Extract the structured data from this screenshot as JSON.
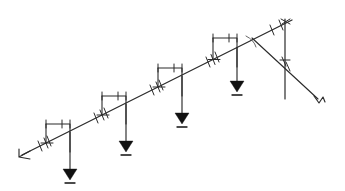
{
  "figure": {
    "type": "structural-schematic",
    "title": "",
    "background_color": "#ffffff",
    "line_color": "#2b2b2b",
    "fill_color": "#111111",
    "width": 345,
    "height": 191
  },
  "beam": {
    "name": "inclined-beam",
    "start": {
      "x": 22,
      "y": 155
    },
    "end": {
      "x": 292,
      "y": 20
    },
    "label": "",
    "tick_marks": [
      {
        "x": 40,
        "y": 146
      },
      {
        "x": 49,
        "y": 141
      },
      {
        "x": 96,
        "y": 118
      },
      {
        "x": 106,
        "y": 113
      },
      {
        "x": 152,
        "y": 90
      },
      {
        "x": 161,
        "y": 85
      },
      {
        "x": 208,
        "y": 62
      },
      {
        "x": 217,
        "y": 57
      },
      {
        "x": 272,
        "y": 30
      },
      {
        "x": 281,
        "y": 25
      }
    ]
  },
  "left_support": {
    "name": "left-end-hook",
    "x": 22,
    "y": 155,
    "label": ""
  },
  "hangers": [
    {
      "id": "hanger-1",
      "bracket_left_x": 46,
      "bracket_right_x": 70,
      "bracket_top_y": 124,
      "rod_x": 70,
      "rod_top_y": 132,
      "arrow_tip_y": 180,
      "load_label": ""
    },
    {
      "id": "hanger-2",
      "bracket_left_x": 102,
      "bracket_right_x": 126,
      "bracket_top_y": 96,
      "rod_x": 126,
      "rod_top_y": 104,
      "arrow_tip_y": 152,
      "load_label": ""
    },
    {
      "id": "hanger-3",
      "bracket_left_x": 158,
      "bracket_right_x": 182,
      "bracket_top_y": 68,
      "rod_x": 182,
      "rod_top_y": 76,
      "arrow_tip_y": 124,
      "load_label": ""
    },
    {
      "id": "hanger-4",
      "bracket_left_x": 213,
      "bracket_right_x": 237,
      "bracket_top_y": 38,
      "rod_x": 237,
      "rod_top_y": 47,
      "arrow_tip_y": 92,
      "load_label": ""
    }
  ],
  "right_assembly": {
    "post": {
      "name": "vertical-post",
      "x": 285,
      "top_y": 19,
      "bottom_y": 99,
      "label": ""
    },
    "guy_wire": {
      "name": "diagonal-guy-wire",
      "start": {
        "x": 252,
        "y": 38
      },
      "end": {
        "x": 320,
        "y": 101
      },
      "label": ""
    },
    "angle_marker": {
      "name": "angle-arc",
      "x": 254,
      "y": 40,
      "label": ""
    },
    "end_hook": {
      "name": "guy-wire-end-hook",
      "x": 320,
      "y": 101,
      "label": ""
    },
    "post_tick_marks": [
      {
        "x": 285,
        "y": 22
      },
      {
        "x": 285,
        "y": 61
      },
      {
        "x": 285,
        "y": 66
      }
    ]
  },
  "annotations": {
    "caption": "",
    "units": "",
    "notes": ""
  }
}
